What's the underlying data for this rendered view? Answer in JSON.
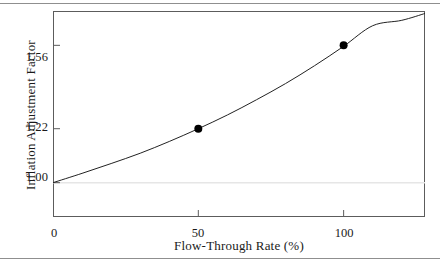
{
  "figure": {
    "has_top_rule": true,
    "has_bottom_rule": true,
    "rule_color": "#8f8f8f",
    "frame_color": "#5c5c5c",
    "background": "#ffffff"
  },
  "chart_data": {
    "type": "line",
    "title": "",
    "subtitle": "",
    "xlabel": "Flow-Through Rate (%)",
    "ylabel": "Inflation Adjustment Factor",
    "xlim": [
      0,
      128
    ],
    "ylim": [
      0.86,
      1.7
    ],
    "xticks": [
      0,
      50,
      100
    ],
    "xticklabels": [
      "0",
      "50",
      "100"
    ],
    "yticks": [
      1.0,
      1.22,
      1.56
    ],
    "yticklabels": [
      "1.00",
      "1.22",
      "1.56"
    ],
    "grid": false,
    "gridlines": [
      {
        "axis": "y",
        "value": 1.0,
        "color": "#e6e6e6"
      }
    ],
    "legend": null,
    "series": [
      {
        "name": "Inflation adjustment factor",
        "type": "line",
        "color": "#222222",
        "linewidth": 1,
        "x": [
          0,
          10,
          20,
          30,
          40,
          50,
          60,
          70,
          80,
          90,
          100,
          110,
          120,
          128
        ],
        "y": [
          1.0,
          1.038,
          1.078,
          1.12,
          1.168,
          1.22,
          1.276,
          1.338,
          1.404,
          1.477,
          1.556,
          1.64,
          1.662,
          1.69
        ]
      },
      {
        "name": "Marked data points",
        "type": "scatter",
        "color": "#000000",
        "marker": "filled-circle",
        "markersize": 8,
        "x": [
          50,
          100
        ],
        "y": [
          1.22,
          1.56
        ],
        "labels": [
          "50, 1.22",
          "100, 1.56"
        ]
      }
    ]
  }
}
